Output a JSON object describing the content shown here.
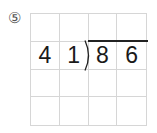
{
  "problem": {
    "number_label": "⑤"
  },
  "grid": {
    "rows": 4,
    "cols": 4,
    "cells": [
      [
        "",
        "",
        "",
        ""
      ],
      [
        "4",
        "1",
        "8",
        "6"
      ],
      [
        "",
        "",
        "",
        ""
      ],
      [
        "",
        "",
        "",
        ""
      ]
    ]
  },
  "division": {
    "divisor": "41",
    "dividend": "86"
  },
  "colors": {
    "grid_line": "#d6d6d6",
    "digit": "#1a1a1a",
    "bracket": "#222222"
  }
}
